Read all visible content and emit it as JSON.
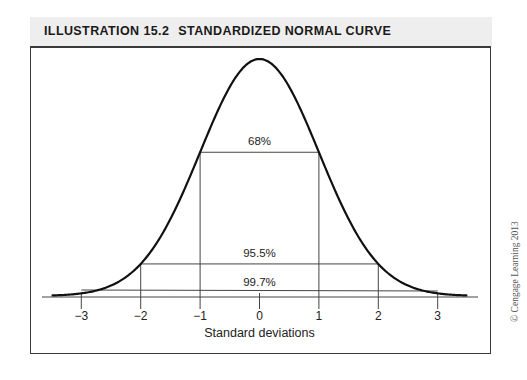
{
  "header": {
    "number": "ILLUSTRATION 15.2",
    "title": "STANDARDIZED NORMAL CURVE"
  },
  "copyright": "© Cengage Learning 2013",
  "chart_data": {
    "type": "line",
    "xlabel": "Standard deviations",
    "ylabel": "",
    "x_ticks": [
      -3,
      -2,
      -1,
      0,
      1,
      2,
      3
    ],
    "x_tick_labels": [
      "−3",
      "−2",
      "−1",
      "0",
      "1",
      "2",
      "3"
    ],
    "xlim": [
      -3.5,
      3.5
    ],
    "curve": "standard normal density",
    "intervals": [
      {
        "label": "68%",
        "from": -1,
        "to": 1
      },
      {
        "label": "95.5%",
        "from": -2,
        "to": 2
      },
      {
        "label": "99.7%",
        "from": -3,
        "to": 3
      }
    ],
    "grid": false,
    "legend": null
  },
  "colors": {
    "curve": "#111111",
    "lines": "#444444",
    "header_bg": "#eeeeee"
  }
}
